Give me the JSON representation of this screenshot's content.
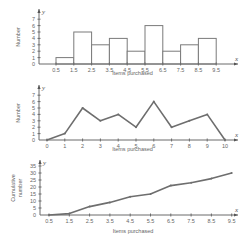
{
  "chart_data": [
    {
      "type": "bar",
      "subtype": "histogram",
      "title": "",
      "xlabel": "Items purchased",
      "ylabel": "Number",
      "x_axis_var": "x",
      "y_axis_var": "y",
      "x_ticks": [
        "0.5",
        "1.5",
        "2.5",
        "3.5",
        "4.5",
        "5.5",
        "6.5",
        "7.5",
        "8.5",
        "9.5"
      ],
      "y_ticks": [
        "0",
        "1",
        "2",
        "3",
        "4",
        "5",
        "6",
        "7"
      ],
      "ylim": [
        0,
        7
      ],
      "bins": [
        [
          0.5,
          1.5
        ],
        [
          1.5,
          2.5
        ],
        [
          2.5,
          3.5
        ],
        [
          3.5,
          4.5
        ],
        [
          4.5,
          5.5
        ],
        [
          5.5,
          6.5
        ],
        [
          6.5,
          7.5
        ],
        [
          7.5,
          8.5
        ],
        [
          8.5,
          9.5
        ]
      ],
      "values": [
        1,
        5,
        3,
        4,
        2,
        6,
        2,
        3,
        4
      ],
      "grid": false
    },
    {
      "type": "line",
      "subtype": "frequency polygon",
      "title": "",
      "xlabel": "Items purchased",
      "ylabel": "Number",
      "x_axis_var": "x",
      "y_axis_var": "y",
      "x_ticks": [
        "0",
        "1",
        "2",
        "3",
        "4",
        "5",
        "6",
        "7",
        "8",
        "9",
        "10"
      ],
      "y_ticks": [
        "0",
        "1",
        "2",
        "3",
        "4",
        "5",
        "6",
        "7"
      ],
      "ylim": [
        0,
        7
      ],
      "x": [
        0,
        1,
        2,
        3,
        4,
        5,
        6,
        7,
        8,
        9,
        10
      ],
      "values": [
        0,
        1,
        5,
        3,
        4,
        2,
        6,
        2,
        3,
        4,
        0
      ],
      "grid": false
    },
    {
      "type": "line",
      "subtype": "cumulative frequency",
      "title": "",
      "xlabel": "Items purchased",
      "ylabel": "Cumulative number",
      "x_axis_var": "x",
      "y_axis_var": "y",
      "x_ticks": [
        "0.5",
        "1.5",
        "2.5",
        "3.5",
        "4.5",
        "5.5",
        "6.5",
        "7.5",
        "8.5",
        "9.5"
      ],
      "y_ticks": [
        "0",
        "5",
        "10",
        "15",
        "20",
        "25",
        "30",
        "35"
      ],
      "ylim": [
        0,
        35
      ],
      "x": [
        0.5,
        1.5,
        2.5,
        3.5,
        4.5,
        5.5,
        6.5,
        7.5,
        8.5,
        9.5
      ],
      "values": [
        0,
        1,
        6,
        9,
        13,
        15,
        21,
        23,
        26,
        30
      ],
      "grid": false
    }
  ]
}
